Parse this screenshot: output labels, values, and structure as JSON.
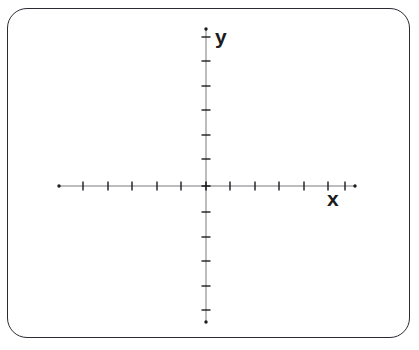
{
  "figure": {
    "kind": "cartesian-coordinate-plane",
    "background_color": "#ffffff",
    "frame": {
      "name": "rounded-rectangle-border",
      "stroke_color": "#2b2b33",
      "stroke_width": 1,
      "corner_radius": 20,
      "x": 7,
      "y": 8,
      "width": 403,
      "height": 330
    },
    "axis_color": "#7a7a80",
    "tick_color": "#1b1b20",
    "endpoint_color": "#1b1b20"
  },
  "labels": {
    "y_axis": "y",
    "x_axis": "x"
  },
  "chart_data": {
    "type": "scatter",
    "title": "",
    "subtitle": "",
    "xlabel": "x",
    "ylabel": "y",
    "grid": false,
    "legend": null,
    "annotations": [],
    "series": [
      {
        "name": "plotted-points",
        "x": [],
        "y": [],
        "values": []
      }
    ],
    "origin": {
      "x_px": 206,
      "y_px": 186,
      "value": [
        0,
        0
      ]
    },
    "x_axis": {
      "orientation": "horizontal",
      "pixel_start": 59,
      "pixel_end": 355,
      "tick_spacing_px": 24.5,
      "tick_positions_px": [
        83,
        108,
        132,
        157,
        181,
        230,
        255,
        279,
        304,
        328,
        345
      ],
      "ticks_left_of_origin": 5,
      "ticks_right_of_origin": 6,
      "tick_labels": [],
      "xlim": [
        -6,
        6
      ],
      "endpoint_markers": [
        "dot-left",
        "dot-right"
      ]
    },
    "y_axis": {
      "orientation": "vertical",
      "pixel_start": 29,
      "pixel_end": 322,
      "tick_spacing_px": 24.5,
      "tick_positions_px": [
        37,
        61,
        86,
        110,
        135,
        159,
        212,
        237,
        261,
        286,
        310
      ],
      "ticks_above_origin": 6,
      "ticks_below_origin": 5,
      "tick_labels": [],
      "ylim": [
        -6,
        6
      ],
      "endpoint_markers": [
        "dot-top",
        "dot-bottom"
      ]
    }
  }
}
